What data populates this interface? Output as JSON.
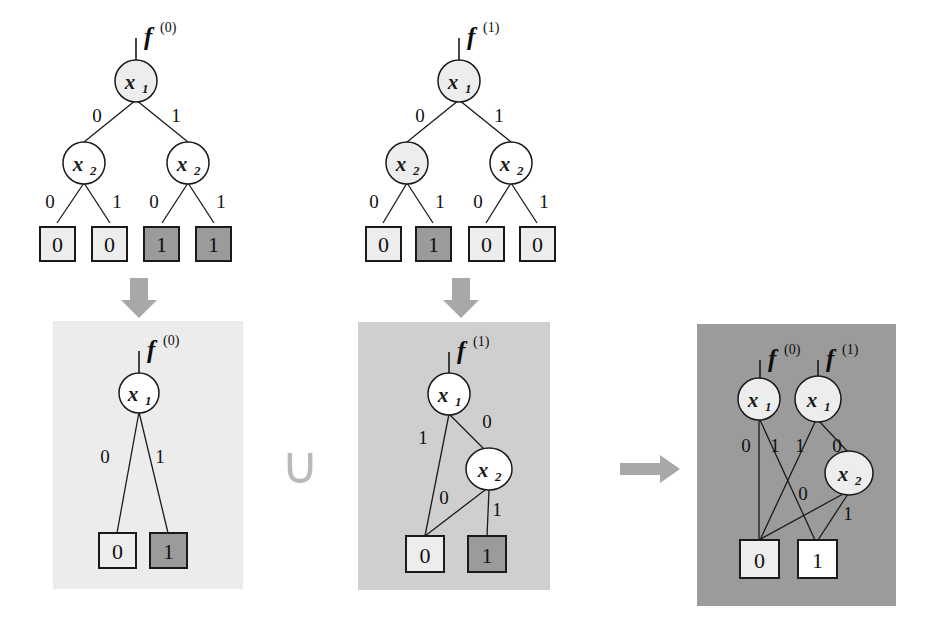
{
  "figure": {
    "background": "#ffffff"
  },
  "colors": {
    "node_fill_light": "#ededed",
    "node_fill_white": "#ffffff",
    "terminal_zero_fill": "#ededed",
    "terminal_one_fill": "#9b9b9b",
    "stroke": "#1a1a1a",
    "panel_very_light": "#ececec",
    "panel_light": "#cfcfcf",
    "panel_dark": "#9b9b9b",
    "arrow_gray": "#a8a8a8",
    "union_gray": "#b9b9b9"
  },
  "top_trees": [
    {
      "id": "tree-f0",
      "function_label": "f",
      "function_superscript": "(0)",
      "root": {
        "var": "x",
        "sub": "1",
        "fill": "shaded"
      },
      "level2": [
        {
          "var": "x",
          "sub": "2",
          "fill": "white"
        },
        {
          "var": "x",
          "sub": "2",
          "fill": "white"
        }
      ],
      "root_edge_labels": [
        "0",
        "1"
      ],
      "level2_edge_labels": [
        "0",
        "1",
        "0",
        "1"
      ],
      "terminals": [
        {
          "value": "0",
          "fill": "light"
        },
        {
          "value": "0",
          "fill": "light"
        },
        {
          "value": "1",
          "fill": "dark"
        },
        {
          "value": "1",
          "fill": "dark"
        }
      ]
    },
    {
      "id": "tree-f1",
      "function_label": "f",
      "function_superscript": "(1)",
      "root": {
        "var": "x",
        "sub": "1",
        "fill": "shaded"
      },
      "level2": [
        {
          "var": "x",
          "sub": "2",
          "fill": "shaded"
        },
        {
          "var": "x",
          "sub": "2",
          "fill": "white"
        }
      ],
      "root_edge_labels": [
        "0",
        "1"
      ],
      "level2_edge_labels": [
        "0",
        "1",
        "0",
        "1"
      ],
      "terminals": [
        {
          "value": "0",
          "fill": "light"
        },
        {
          "value": "1",
          "fill": "dark"
        },
        {
          "value": "0",
          "fill": "light"
        },
        {
          "value": "0",
          "fill": "light"
        }
      ]
    }
  ],
  "bottom_panels": [
    {
      "id": "panel-bdd-f0",
      "shade": "very_light",
      "functions": [
        {
          "label": "f",
          "superscript": "(0)"
        }
      ],
      "decision_nodes": [
        {
          "var": "x",
          "sub": "1"
        }
      ],
      "edge_labels": [
        "0",
        "1"
      ],
      "terminals": [
        {
          "value": "0",
          "fill": "light"
        },
        {
          "value": "1",
          "fill": "dark"
        }
      ]
    },
    {
      "id": "panel-bdd-f1",
      "shade": "light",
      "functions": [
        {
          "label": "f",
          "superscript": "(1)"
        }
      ],
      "decision_nodes": [
        {
          "var": "x",
          "sub": "1"
        },
        {
          "var": "x",
          "sub": "2"
        }
      ],
      "edge_labels": [
        "1",
        "0",
        "0",
        "1"
      ],
      "terminals": [
        {
          "value": "0",
          "fill": "light"
        },
        {
          "value": "1",
          "fill": "dark"
        }
      ]
    },
    {
      "id": "panel-bdd-merged",
      "shade": "dark",
      "functions": [
        {
          "label": "f",
          "superscript": "(0)"
        },
        {
          "label": "f",
          "superscript": "(1)"
        }
      ],
      "decision_nodes": [
        {
          "var": "x",
          "sub": "1"
        },
        {
          "var": "x",
          "sub": "1"
        },
        {
          "var": "x",
          "sub": "2"
        }
      ],
      "edge_labels": [
        "0",
        "1",
        "1",
        "0",
        "0",
        "1"
      ],
      "terminals": [
        {
          "value": "0",
          "fill": "light"
        },
        {
          "value": "1",
          "fill": "white"
        }
      ]
    }
  ],
  "operators": {
    "union": "∪",
    "down_arrow": "down-arrow",
    "right_arrow": "right-arrow"
  }
}
